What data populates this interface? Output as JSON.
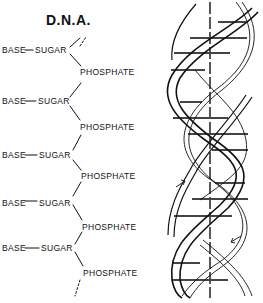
{
  "diagram": {
    "title": "D.N.A.",
    "chain": [
      {
        "base": "BASE",
        "sugar": "SUGAR",
        "phosphate": "PHOSPHATE"
      },
      {
        "base": "BASE",
        "sugar": "SUGAR",
        "phosphate": "PHOSPHATE"
      },
      {
        "base": "BASE",
        "sugar": "SUGAR",
        "phosphate": "PHOSPHATE"
      },
      {
        "base": "BASE",
        "sugar": "SUGAR",
        "phosphate": "PHOSPHATE"
      },
      {
        "base": "BASE",
        "sugar": "SUGAR",
        "phosphate": "PHOSPHATE"
      }
    ],
    "helix": {
      "description": "double helix with base-pair rungs and central axis",
      "strand_direction_arrows": [
        "up",
        "down"
      ],
      "line_color": "#111111"
    }
  }
}
